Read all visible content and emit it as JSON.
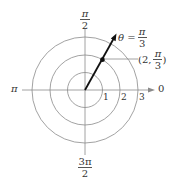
{
  "diagram": {
    "type": "polar-coordinate-plot",
    "angle_labels": {
      "top_num": "π",
      "top_den": "2",
      "left": "π",
      "right": "0",
      "bottom_num": "3π",
      "bottom_den": "2"
    },
    "radius_labels": [
      "1",
      "2",
      "3"
    ],
    "ray": {
      "label_prefix": "θ =",
      "label_num": "π",
      "label_den": "3"
    },
    "point": {
      "label_open": "(2,",
      "label_num": "π",
      "label_den": "3",
      "label_close": ")",
      "r": 2,
      "theta": "π/3"
    },
    "colors": {
      "grid": "#8a8a8a",
      "ray": "#111111",
      "text": "#333333"
    }
  }
}
